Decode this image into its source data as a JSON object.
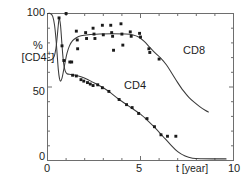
{
  "figure": {
    "background": "#ffffff",
    "line_color": "#3a3a3a",
    "marker_color": "#1a1a1a",
    "axis_color": "#6e6e6e"
  },
  "axes": {
    "y_label_line1": "%",
    "y_label_line2_prefix": "[CD4",
    "y_label_line2_sup": "+",
    "y_label_line2_suffix": "]",
    "y_ticks": [
      "100",
      "50",
      "0"
    ],
    "x_ticks": [
      "0",
      "5",
      "10"
    ],
    "x_title": "t [year]"
  },
  "series_labels": {
    "cd8": "CD8",
    "cd4": "CD4"
  },
  "chart_data": {
    "type": "scatter",
    "title": "",
    "xlabel": "t [year]",
    "ylabel": "% [CD4+]",
    "xlim": [
      0,
      10
    ],
    "ylim": [
      0,
      100
    ],
    "xticks": [
      0,
      5,
      10
    ],
    "xminorticks": [
      1,
      2,
      3,
      4,
      6,
      7,
      8,
      9
    ],
    "yticks": [
      0,
      50,
      100
    ],
    "yminorticks": [
      10,
      20,
      30,
      40,
      60,
      70,
      80,
      90
    ],
    "grid": false,
    "frame": "box",
    "legend": "inline-annotations",
    "series": [
      {
        "name": "CD8",
        "marker": "square",
        "fit_line": [
          [
            0.0,
            100.0
          ],
          [
            0.15,
            100.0
          ],
          [
            0.28,
            98.0
          ],
          [
            0.38,
            92.0
          ],
          [
            0.46,
            82.0
          ],
          [
            0.52,
            72.0
          ],
          [
            0.58,
            62.0
          ],
          [
            0.64,
            56.0
          ],
          [
            0.7,
            54.0
          ],
          [
            0.78,
            56.0
          ],
          [
            0.86,
            61.0
          ],
          [
            0.95,
            67.0
          ],
          [
            1.05,
            73.0
          ],
          [
            1.18,
            78.0
          ],
          [
            1.35,
            81.5
          ],
          [
            1.55,
            83.5
          ],
          [
            1.8,
            84.8
          ],
          [
            2.2,
            85.6
          ],
          [
            2.8,
            86.0
          ],
          [
            3.5,
            86.2
          ],
          [
            4.2,
            86.0
          ],
          [
            4.6,
            85.4
          ],
          [
            4.9,
            84.0
          ],
          [
            5.2,
            81.0
          ],
          [
            5.5,
            77.0
          ],
          [
            5.8,
            73.0
          ],
          [
            6.1,
            69.5
          ],
          [
            6.4,
            65.0
          ],
          [
            6.7,
            59.0
          ],
          [
            7.0,
            53.0
          ],
          [
            7.3,
            47.5
          ],
          [
            7.6,
            43.0
          ],
          [
            7.9,
            39.5
          ],
          [
            8.2,
            36.5
          ],
          [
            8.5,
            34.0
          ],
          [
            8.65,
            33.0
          ]
        ],
        "points": [
          [
            1.0,
            100.0
          ],
          [
            1.55,
            88.0
          ],
          [
            1.6,
            82.0
          ],
          [
            1.62,
            76.0
          ],
          [
            1.3,
            67.0
          ],
          [
            2.05,
            87.0
          ],
          [
            2.1,
            83.0
          ],
          [
            2.45,
            90.0
          ],
          [
            2.5,
            86.0
          ],
          [
            2.55,
            83.0
          ],
          [
            2.95,
            92.0
          ],
          [
            3.0,
            85.5
          ],
          [
            3.4,
            92.0
          ],
          [
            3.45,
            87.0
          ],
          [
            3.5,
            84.5
          ],
          [
            3.55,
            75.0
          ],
          [
            3.95,
            93.0
          ],
          [
            4.0,
            86.0
          ],
          [
            4.05,
            78.5
          ],
          [
            4.45,
            87.5
          ],
          [
            4.5,
            84.5
          ],
          [
            4.95,
            86.5
          ],
          [
            5.0,
            84.0
          ],
          [
            5.45,
            76.0
          ],
          [
            5.5,
            73.5
          ],
          [
            6.0,
            69.0
          ]
        ]
      },
      {
        "name": "CD4",
        "marker": "square",
        "fit_line": [
          [
            0.0,
            68.0
          ],
          [
            0.2,
            68.5
          ],
          [
            0.35,
            70.5
          ],
          [
            0.45,
            76.0
          ],
          [
            0.52,
            84.0
          ],
          [
            0.58,
            92.0
          ],
          [
            0.63,
            97.0
          ],
          [
            0.7,
            92.0
          ],
          [
            0.76,
            82.0
          ],
          [
            0.82,
            72.0
          ],
          [
            0.88,
            65.0
          ],
          [
            0.95,
            61.0
          ],
          [
            1.05,
            59.0
          ],
          [
            1.25,
            58.5
          ],
          [
            1.5,
            58.0
          ],
          [
            1.8,
            57.0
          ],
          [
            2.1,
            55.5
          ],
          [
            2.4,
            53.5
          ],
          [
            2.7,
            51.5
          ],
          [
            3.0,
            49.5
          ],
          [
            3.4,
            46.0
          ],
          [
            3.8,
            42.0
          ],
          [
            4.2,
            38.5
          ],
          [
            4.6,
            35.0
          ],
          [
            5.0,
            31.5
          ],
          [
            5.4,
            27.0
          ],
          [
            5.8,
            22.0
          ],
          [
            6.2,
            16.5
          ],
          [
            6.6,
            11.0
          ],
          [
            7.0,
            6.0
          ],
          [
            7.4,
            3.0
          ],
          [
            7.8,
            1.6
          ],
          [
            8.3,
            1.2
          ],
          [
            9.0,
            1.1
          ],
          [
            9.6,
            1.1
          ]
        ],
        "points": [
          [
            0.62,
            97.0
          ],
          [
            0.78,
            78.0
          ],
          [
            0.88,
            68.0
          ],
          [
            1.2,
            67.0
          ],
          [
            1.35,
            58.0
          ],
          [
            1.55,
            57.5
          ],
          [
            1.8,
            55.0
          ],
          [
            1.95,
            54.0
          ],
          [
            2.15,
            53.0
          ],
          [
            2.3,
            52.0
          ],
          [
            2.45,
            51.0
          ],
          [
            2.7,
            51.5
          ],
          [
            2.95,
            49.5
          ],
          [
            3.3,
            47.0
          ],
          [
            3.85,
            41.5
          ],
          [
            4.25,
            38.0
          ],
          [
            4.55,
            36.0
          ],
          [
            4.9,
            32.0
          ],
          [
            5.35,
            28.5
          ],
          [
            5.75,
            23.0
          ],
          [
            6.1,
            17.5
          ],
          [
            6.45,
            16.5
          ],
          [
            6.9,
            16.5
          ]
        ]
      }
    ]
  }
}
